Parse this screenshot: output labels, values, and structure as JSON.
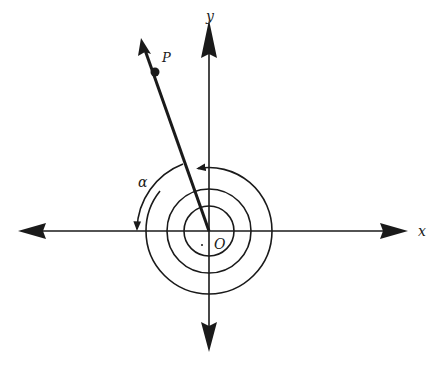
{
  "diagram": {
    "colors": {
      "ink": "#1a1a1a",
      "background": "#ffffff"
    },
    "origin": {
      "x": 209,
      "y": 231
    },
    "axes": {
      "x_label": "x",
      "y_label": "y",
      "x_axis": {
        "x1": 18,
        "x2": 408
      },
      "y_axis": {
        "y1": 20,
        "y2": 352
      }
    },
    "labels": {
      "origin": "O",
      "point": "P",
      "angle": "α"
    },
    "ray": {
      "tip_x": 141,
      "tip_y": 38,
      "point_x": 155,
      "point_y": 72
    },
    "spiral_radii": [
      25,
      42,
      63
    ],
    "angle_arc_radius": 72
  }
}
